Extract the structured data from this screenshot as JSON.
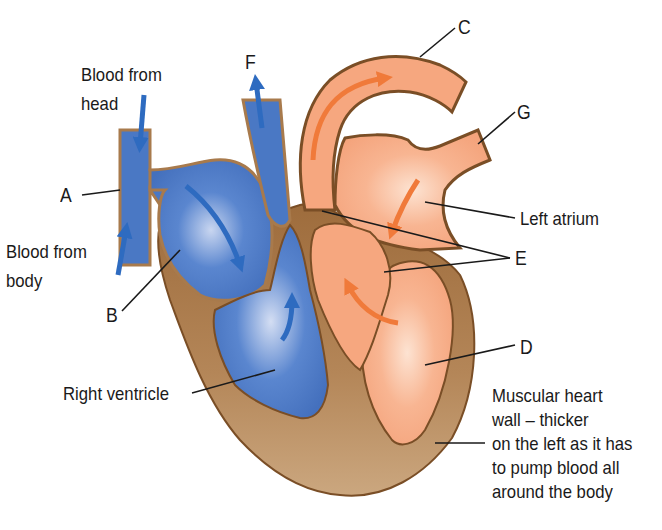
{
  "diagram": {
    "colors": {
      "deoxygenated": "#4a78c4",
      "oxygenated": "#f6a77f",
      "muscle_wall": "#a87a4c",
      "outline": "#7a4e26",
      "arrow_blue": "#2e6bc0",
      "arrow_orange": "#f07a3a"
    },
    "labels": {
      "blood_from_head": [
        "Blood from",
        "head"
      ],
      "blood_from_body": [
        "Blood from",
        "body"
      ],
      "a": "A",
      "b": "B",
      "c": "C",
      "d": "D",
      "e": "E",
      "f": "F",
      "g": "G",
      "left_atrium": "Left atrium",
      "right_ventricle": "Right ventricle",
      "muscular_wall": [
        "Muscular heart",
        "wall – thicker",
        "on the left as it has",
        "to pump blood all",
        "around the body"
      ]
    }
  }
}
